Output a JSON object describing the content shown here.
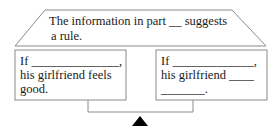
{
  "header_box": {
    "line1": "The information in part __ suggests",
    "line2": "a rule."
  },
  "left_box": {
    "line1": "If ______________,",
    "line2": "his girlfriend feels",
    "line3": "good."
  },
  "right_box": {
    "line1": "If _____________,",
    "line2": "his girlfriend ____",
    "line3": "_______."
  },
  "icons": {
    "fulcrum": "fulcrum-triangle-icon"
  },
  "colors": {
    "stroke": "#8a8a8a",
    "text": "#1a1a1a",
    "fulcrum": "#000000"
  }
}
